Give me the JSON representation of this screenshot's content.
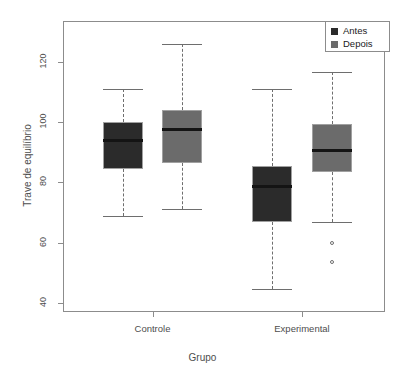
{
  "chart_data": {
    "type": "boxplot",
    "title": "",
    "xlabel": "Grupo",
    "ylabel": "Trave de equilíbrio",
    "categories": [
      "Controle",
      "Experimental"
    ],
    "ylim": [
      36,
      130
    ],
    "yticks": [
      40,
      60,
      80,
      100,
      120
    ],
    "ytick_labels": [
      "40",
      "60",
      "80",
      "100",
      "120"
    ],
    "grid": false,
    "legend_position": "top-right",
    "series": [
      {
        "name": "Antes",
        "color": "#2b2b2b",
        "boxes": [
          {
            "category": "Controle",
            "whisker_low": 69,
            "q1": 84.5,
            "median": 94,
            "q3": 100,
            "whisker_high": 111,
            "outliers": []
          },
          {
            "category": "Experimental",
            "whisker_low": 44.5,
            "q1": 67,
            "median": 78.5,
            "q3": 85.5,
            "whisker_high": 111,
            "outliers": []
          }
        ]
      },
      {
        "name": "Depois",
        "color": "#6b6b6b",
        "boxes": [
          {
            "category": "Controle",
            "whisker_low": 71,
            "q1": 86.5,
            "median": 97.5,
            "q3": 104,
            "whisker_high": 126,
            "outliers": []
          },
          {
            "category": "Experimental",
            "whisker_low": 67,
            "q1": 83.5,
            "median": 90.5,
            "q3": 99.5,
            "whisker_high": 116.5,
            "outliers": [
              60,
              53.5
            ]
          }
        ]
      }
    ]
  },
  "legend": {
    "items": [
      {
        "label": "Antes",
        "color": "#2b2b2b"
      },
      {
        "label": "Depois",
        "color": "#6b6b6b"
      }
    ]
  },
  "axes": {
    "y_title": "Trave de equilíbrio",
    "x_title": "Grupo",
    "y_tick_labels": [
      "40",
      "60",
      "80",
      "100",
      "120"
    ],
    "x_tick_labels": [
      "Controle",
      "Experimental"
    ]
  },
  "colors": {
    "antes": "#2b2b2b",
    "depois": "#6b6b6b",
    "axis": "#8c8c8c",
    "whisker": "#6e6e6e",
    "median": "#141414",
    "background": "#ffffff"
  }
}
